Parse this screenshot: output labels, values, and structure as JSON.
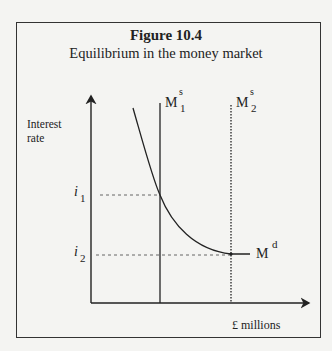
{
  "figure": {
    "number": "Figure 10.4",
    "caption": "Equilibrium in the money market"
  },
  "axes": {
    "y_label_line1": "Interest",
    "y_label_line2": "rate",
    "x_label": "£ millions"
  },
  "curves": {
    "supply1": {
      "base": "M",
      "sup": "s",
      "sub": "1",
      "style": "solid"
    },
    "supply2": {
      "base": "M",
      "sup": "s",
      "sub": "2",
      "style": "dotted"
    },
    "demand": {
      "base": "M",
      "sup": "d"
    }
  },
  "levels": {
    "i1": {
      "base": "i",
      "sub": "1"
    },
    "i2": {
      "base": "i",
      "sub": "2"
    }
  },
  "colors": {
    "ink": "#222222",
    "background": "#f4f4f2"
  }
}
